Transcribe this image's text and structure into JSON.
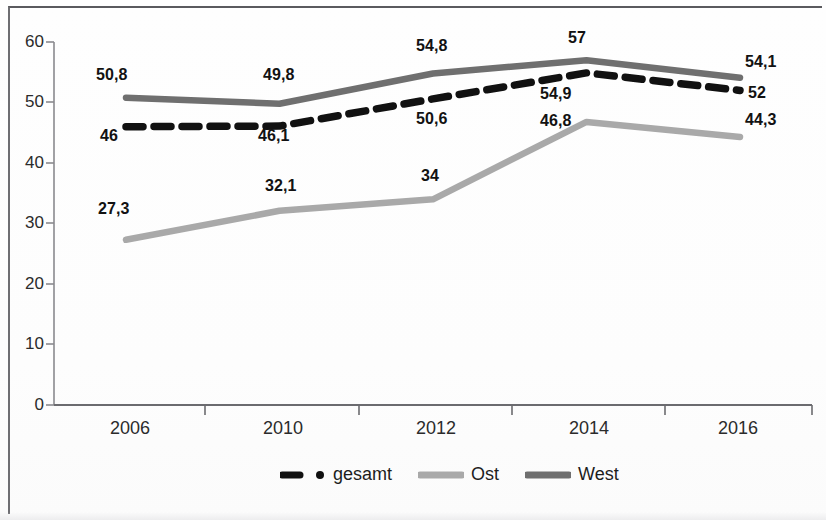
{
  "chart_data": {
    "type": "line",
    "title": "",
    "subtitle": "",
    "xlabel": "",
    "ylabel": "",
    "categories": [
      "2006",
      "2010",
      "2012",
      "2014",
      "2016"
    ],
    "ylim": [
      0,
      60
    ],
    "y_ticks": [
      "0",
      "10",
      "20",
      "30",
      "40",
      "50",
      "60"
    ],
    "y_tick_values": [
      0,
      10,
      20,
      30,
      40,
      50,
      60
    ],
    "grid": false,
    "legend_position": "bottom",
    "series": [
      {
        "name": "gesamt",
        "values": [
          46,
          46.1,
          50.6,
          54.9,
          52
        ],
        "labels": [
          "46",
          "46,1",
          "50,6",
          "54,9",
          "52"
        ],
        "color": "#111111",
        "style": "dashed"
      },
      {
        "name": "Ost",
        "values": [
          27.3,
          32.1,
          34,
          46.8,
          44.3
        ],
        "labels": [
          "27,3",
          "32,1",
          "34",
          "46,8",
          "44,3"
        ],
        "color": "#a9a9a9",
        "style": "solid"
      },
      {
        "name": "West",
        "values": [
          50.8,
          49.8,
          54.8,
          57,
          54.1
        ],
        "labels": [
          "50,8",
          "49,8",
          "54,8",
          "57",
          "54,1"
        ],
        "color": "#6f6f6f",
        "style": "solid"
      }
    ]
  },
  "legend": {
    "items": [
      {
        "label": "gesamt",
        "swatch": "dashed-black-line-swatch"
      },
      {
        "label": "Ost",
        "swatch": "light-gray-line-swatch"
      },
      {
        "label": "West",
        "swatch": "dark-gray-line-swatch"
      }
    ]
  },
  "axis": {
    "y_labels": [
      "60",
      "50",
      "40",
      "30",
      "20",
      "10",
      "0"
    ],
    "x_labels": [
      "2006",
      "2010",
      "2012",
      "2014",
      "2016"
    ]
  }
}
